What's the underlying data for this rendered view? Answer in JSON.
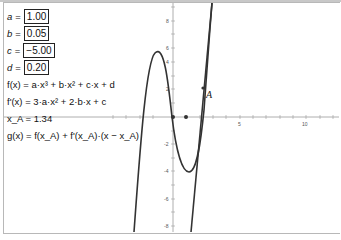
{
  "algebra": {
    "sliders": [
      {
        "name": "a",
        "value": "1.00"
      },
      {
        "name": "b",
        "value": "0.05"
      },
      {
        "name": "c",
        "value": "−5.00"
      },
      {
        "name": "d",
        "value": "0.20"
      }
    ],
    "f_def": "f(x) = a·x³ + b·x² + c·x + d",
    "f_prime_def": "f'(x) = 3·a·x² + 2·b·x + c",
    "x_A": "x_A = 1.34",
    "g_def": "g(x) = f(x_A) + f'(x_A)·(x − x_A)"
  },
  "graph": {
    "point_label": "A",
    "x_tick_labels": [
      "5",
      "10"
    ],
    "y_tick_labels": [
      "8",
      "6",
      "4",
      "2",
      "-2",
      "-4",
      "-6",
      "-8"
    ],
    "curve_color": "#333333",
    "axis_color": "#888888"
  }
}
